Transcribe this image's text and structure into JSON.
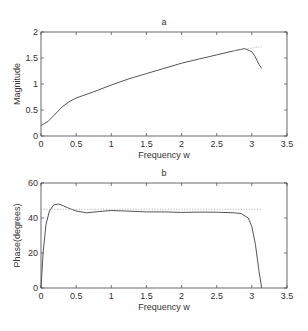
{
  "chart_data": [
    {
      "type": "line",
      "title": "a",
      "xlabel": "Frequency w",
      "ylabel": "Magnitude",
      "xlim": [
        0,
        3.5
      ],
      "ylim": [
        0,
        2
      ],
      "xticks": [
        "0",
        "0.5",
        "1",
        "1.5",
        "2",
        "2.5",
        "3",
        "3.5"
      ],
      "yticks": [
        "0",
        "0.5",
        "1",
        "1.5",
        "2"
      ],
      "grid": false,
      "series": [
        {
          "name": "actual",
          "style": "solid",
          "x": [
            0,
            0.1,
            0.2,
            0.3,
            0.4,
            0.5,
            0.75,
            1.0,
            1.25,
            1.5,
            1.75,
            2.0,
            2.25,
            2.5,
            2.75,
            2.9,
            3.0,
            3.05,
            3.1,
            3.14
          ],
          "y": [
            0.2,
            0.28,
            0.42,
            0.56,
            0.66,
            0.73,
            0.85,
            0.98,
            1.1,
            1.2,
            1.3,
            1.4,
            1.48,
            1.56,
            1.64,
            1.68,
            1.62,
            1.52,
            1.38,
            1.3
          ]
        },
        {
          "name": "ideal",
          "style": "dotted",
          "x": [
            2.75,
            2.9,
            3.0,
            3.1,
            3.14
          ],
          "y": [
            1.64,
            1.67,
            1.69,
            1.71,
            1.72
          ]
        }
      ]
    },
    {
      "type": "line",
      "title": "b",
      "xlabel": "Frequency w",
      "ylabel": "Phase(degrees)",
      "xlim": [
        0,
        3.5
      ],
      "ylim": [
        0,
        60
      ],
      "xticks": [
        "0",
        "0.5",
        "1",
        "1.5",
        "2",
        "2.5",
        "3",
        "3.5"
      ],
      "yticks": [
        "0",
        "20",
        "40",
        "60"
      ],
      "grid": false,
      "series": [
        {
          "name": "actual",
          "style": "solid",
          "x": [
            0,
            0.03,
            0.07,
            0.12,
            0.18,
            0.25,
            0.32,
            0.4,
            0.5,
            0.65,
            0.8,
            1.0,
            1.2,
            1.5,
            1.75,
            2.0,
            2.25,
            2.5,
            2.75,
            2.85,
            2.95,
            3.0,
            3.05,
            3.1,
            3.14
          ],
          "y": [
            0,
            20,
            36,
            44,
            47.5,
            48,
            47,
            45.5,
            44,
            43,
            43.6,
            44.3,
            44,
            43.5,
            43.5,
            43.2,
            43.4,
            43.3,
            43,
            42.5,
            40,
            35,
            25,
            10,
            0
          ]
        },
        {
          "name": "ideal",
          "style": "dotted",
          "x": [
            0,
            3.14
          ],
          "y": [
            45,
            45
          ]
        }
      ]
    }
  ]
}
